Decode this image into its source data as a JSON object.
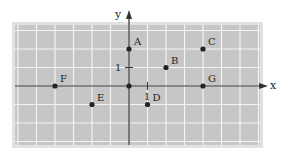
{
  "diagram": {
    "type": "coordinate-plane",
    "axes": {
      "x_label": "x",
      "y_label": "y",
      "x_tick_label": "1",
      "y_tick_label": "1"
    },
    "grid": {
      "x_range": [
        -6,
        7
      ],
      "y_range": [
        -3,
        3
      ],
      "origin_px": [
        129,
        86
      ],
      "unit_px": 18.5
    },
    "colors": {
      "panel_fill": "#c6c6c6",
      "panel_border": "#e2e2e2",
      "grid_line": "#f4f4f4",
      "axis": "#333333",
      "point": "#222222"
    },
    "points": [
      {
        "label": "A",
        "x": 0,
        "y": 2
      },
      {
        "label": "B",
        "x": 2,
        "y": 1
      },
      {
        "label": "C",
        "x": 4,
        "y": 2
      },
      {
        "label": "D",
        "x": 1,
        "y": -1
      },
      {
        "label": "E",
        "x": -2,
        "y": -1
      },
      {
        "label": "F",
        "x": -4,
        "y": 0
      },
      {
        "label": "G",
        "x": 4,
        "y": 0
      },
      {
        "label": "",
        "x": 0,
        "y": 0
      }
    ]
  }
}
